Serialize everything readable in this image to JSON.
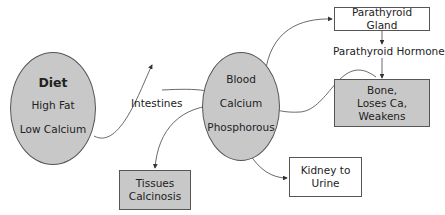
{
  "nodes": {
    "diet": {
      "title": "Diet",
      "line1": "High Fat",
      "line2": "Low Calcium"
    },
    "intestines": {
      "label": "Intestines"
    },
    "blood": {
      "line1": "Blood",
      "line2": "Calcium",
      "line3": "Phosphorous"
    },
    "parathyroid_gland": {
      "label": "Parathyroid Gland"
    },
    "parathyroid_hormone": {
      "label": "Parathyroid Hormone"
    },
    "bone": {
      "line1": "Bone,",
      "line2": "Loses Ca,",
      "line3": "Weakens"
    },
    "kidney": {
      "line1": "Kidney to",
      "line2": "Urine"
    },
    "tissues": {
      "line1": "Tissues",
      "line2": "Calcinosis"
    }
  },
  "colors": {
    "fill": "#c8c8c8",
    "stroke": "#555555"
  }
}
